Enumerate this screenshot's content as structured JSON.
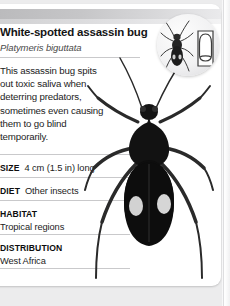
{
  "card": {
    "title": "White-spotted assassin bug",
    "scientific_name": "Platymeris biguttata",
    "description": "This assassin bug spits out toxic saliva when deterring predators, sometimes even causing them to go blind temporarily.",
    "facts": [
      {
        "label": "SIZE",
        "value": "4 cm (1.5 in) long",
        "layout": "inline"
      },
      {
        "label": "DIET",
        "value": "Other insects",
        "layout": "inline"
      },
      {
        "label": "HABITAT",
        "value": "Tropical regions",
        "layout": "stacked"
      },
      {
        "label": "DISTRIBUTION",
        "value": "West Africa",
        "layout": "stacked"
      }
    ]
  },
  "icons": {
    "size_badge": "size-comparison-icon",
    "thumbnail": "thumbnail-outline-icon",
    "small_bug": "assassin-bug-silhouette-icon",
    "main_photo": "assassin-bug-photo"
  },
  "colors": {
    "card_background": "#ffffff",
    "page_background": "#ececed",
    "header_band": "#c6c6c8",
    "rule": "#c9c9cb",
    "body_text": "#1c1c1c",
    "label_text": "#0d0d0d",
    "scientific_name_text": "#4a4a4a",
    "insect_body": "#111111",
    "insect_spot": "#d4d4d4"
  }
}
